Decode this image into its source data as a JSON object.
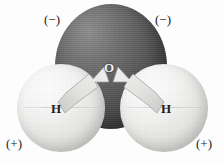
{
  "figure": {
    "background_color": "#fdfdfd"
  },
  "atoms": [
    {
      "id": "oxygen",
      "label": "O",
      "element": "oxygen",
      "color": "#5e5e5e",
      "highlight_color": "#8d8d8d",
      "shadow_color": "#3b3b3b"
    },
    {
      "id": "hydrogen-left",
      "label": "H",
      "element": "hydrogen",
      "color": "#ececea",
      "highlight_color": "#ffffff",
      "shadow_color": "#c4c4c2"
    },
    {
      "id": "hydrogen-right",
      "label": "H",
      "element": "hydrogen",
      "color": "#ececea",
      "highlight_color": "#ffffff",
      "shadow_color": "#c4c4c2"
    }
  ],
  "charges": [
    {
      "id": "neg-left",
      "label": "(−)",
      "sign": "negative",
      "position": "top-left"
    },
    {
      "id": "neg-right",
      "label": "(−)",
      "sign": "negative",
      "position": "top-right"
    },
    {
      "id": "pos-left",
      "label": "(+)",
      "sign": "positive",
      "position": "bottom-left"
    },
    {
      "id": "pos-right",
      "label": "(+)",
      "sign": "positive",
      "position": "bottom-right"
    }
  ],
  "arrows": [
    {
      "id": "dipole-arrow-left",
      "from": "hydrogen-left",
      "to": "oxygen",
      "direction": "up-right",
      "color": "#d9d9d7"
    },
    {
      "id": "dipole-arrow-right",
      "from": "hydrogen-right",
      "to": "oxygen",
      "direction": "up-left",
      "color": "#d9d9d7"
    }
  ]
}
